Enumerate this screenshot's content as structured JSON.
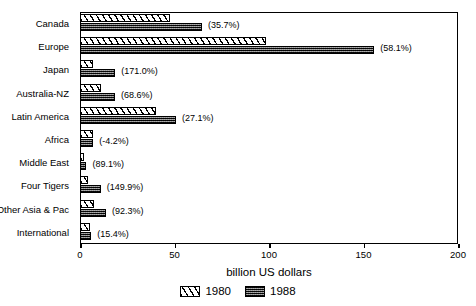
{
  "chart_data": {
    "type": "bar",
    "orientation": "horizontal",
    "title": "",
    "xlabel": "billion US dollars",
    "ylabel": "",
    "xlim": [
      0,
      200
    ],
    "xticks": [
      0,
      50,
      100,
      150,
      200
    ],
    "xtick_labels": [
      "0",
      "50",
      "100",
      "150",
      "200"
    ],
    "grid": false,
    "legend_position": "bottom-center",
    "categories": [
      "Canada",
      "Europe",
      "Japan",
      "Australia-NZ",
      "Latin America",
      "Africa",
      "Middle East",
      "Four Tigers",
      "Other Asia & Pac",
      "International"
    ],
    "series": [
      {
        "name": "1980",
        "pattern": "diagonal-hatch",
        "values": [
          47.6,
          98.5,
          6.9,
          11.0,
          40.0,
          7.0,
          1.8,
          4.4,
          7.2,
          5.2
        ]
      },
      {
        "name": "1988",
        "pattern": "checker-dark",
        "values": [
          64.6,
          155.7,
          18.7,
          18.5,
          50.8,
          6.7,
          3.4,
          11.0,
          13.8,
          6.0
        ]
      }
    ],
    "annotations": [
      "(35.7%)",
      "(58.1%)",
      "(171.0%)",
      "(68.6%)",
      "(27.1%)",
      "(-4.2%)",
      "(89.1%)",
      "(149.9%)",
      "(92.3%)",
      "(15.4%)"
    ]
  },
  "legend": {
    "items": [
      {
        "label": "1980"
      },
      {
        "label": "1988"
      }
    ]
  },
  "colors": {
    "axis": "#000000",
    "series_1980_fill": "#ffffff",
    "series_1988_fill": "#4a4a4a",
    "background": "#ffffff"
  }
}
